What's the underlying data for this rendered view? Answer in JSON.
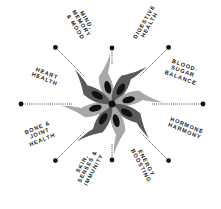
{
  "diagram": {
    "type": "radial-wheel",
    "center_icon": "eight-petal-flower-icon",
    "colors": {
      "petal_light": "#a8a8a8",
      "petal_dark": "#5a5a5a",
      "seed": "#111111",
      "connector": "#222222",
      "text": "#1a1a1a"
    },
    "spokes": [
      {
        "id": "mind-memory-mood",
        "label": "MIND,\nMEMORY\n& MOOD",
        "angle": -112.5
      },
      {
        "id": "digestive-health",
        "label": "DIGESTIVE\nHEALTH",
        "angle": -67.5
      },
      {
        "id": "blood-sugar-balance",
        "label": "BLOOD-\nSUGAR\nBALANCE",
        "angle": -22.5
      },
      {
        "id": "hormone-harmony",
        "label": "HORMONE\nHARMONY",
        "angle": 22.5
      },
      {
        "id": "energy-boosting",
        "label": "ENERGY\nBOOSTING",
        "angle": 67.5
      },
      {
        "id": "skin-senses-immunity",
        "label": "SKIN,\nSENSES &\nIMMUNITY",
        "angle": 112.5
      },
      {
        "id": "bone-joint-health",
        "label": "BONE &\nJOINT\nHEALTH",
        "angle": 157.5
      },
      {
        "id": "heart-health",
        "label": "HEART\nHEALTH",
        "angle": -157.5
      }
    ]
  }
}
